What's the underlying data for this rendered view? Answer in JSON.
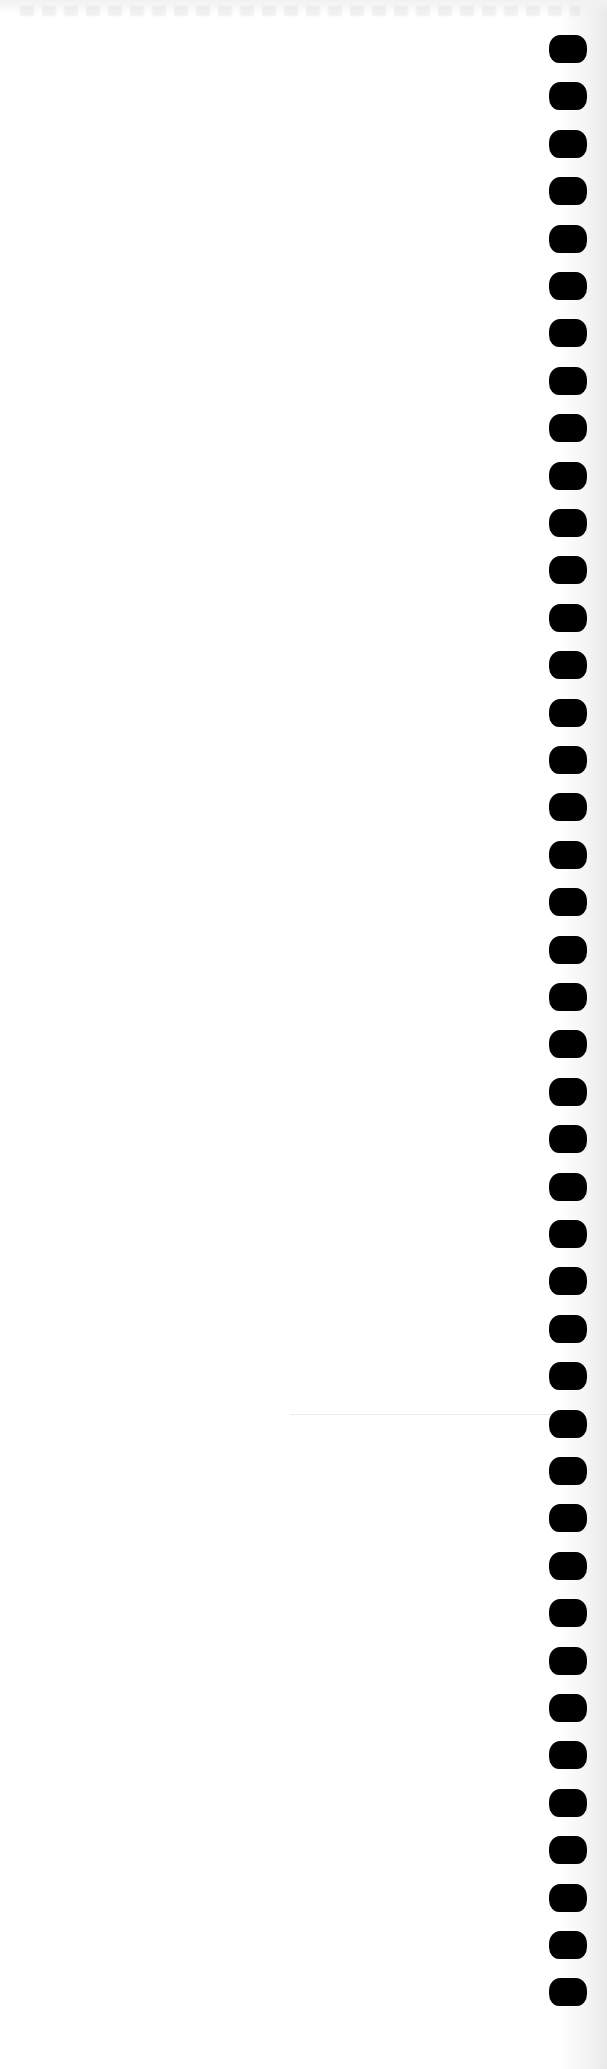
{
  "page": {
    "kind": "blank notebook page (scanned)",
    "background_color": "#ffffff",
    "text": ""
  },
  "binding": {
    "type": "spiral-binding-holes",
    "side": "right",
    "hole_count": 42,
    "hole_color": "#000000",
    "first_hole_top": 35,
    "spacing": 47.4,
    "hole_width": 38,
    "hole_height": 28
  },
  "artifacts": {
    "top_bleed_through": true,
    "faint_rule": {
      "x": 290,
      "y": 1414,
      "width": 270
    }
  }
}
